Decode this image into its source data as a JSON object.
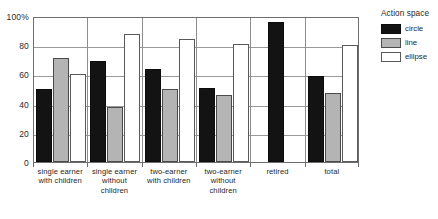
{
  "chart_data": {
    "type": "bar",
    "title": "",
    "subtitle": "",
    "xlabel": "",
    "ylabel": "",
    "ylim": [
      0,
      100
    ],
    "yticks": [
      0,
      20,
      40,
      60,
      80,
      100
    ],
    "ytick_labels": [
      "0",
      "20",
      "40",
      "60",
      "80",
      "100%"
    ],
    "grid": true,
    "legend_position": "right",
    "legend_title": "Action space",
    "categories": [
      "single earner with children",
      "single earner without children",
      "two-earner with children",
      "two-earner without children",
      "retired",
      "total"
    ],
    "category_lines": [
      [
        "single earner",
        "with children"
      ],
      [
        "single earner",
        "without children"
      ],
      [
        "two-earner",
        "with children"
      ],
      [
        "two-earner",
        "without children"
      ],
      [
        "retired",
        ""
      ],
      [
        "total",
        ""
      ]
    ],
    "series": [
      {
        "name": "circle",
        "color": "#131313",
        "values": [
          50,
          69,
          64,
          51,
          96,
          59
        ]
      },
      {
        "name": "line",
        "color": "#b4b4b4",
        "values": [
          71,
          38,
          50,
          46,
          null,
          47
        ]
      },
      {
        "name": "ellipse",
        "color": "#ffffff",
        "values": [
          60,
          88,
          84,
          81,
          null,
          80
        ]
      }
    ]
  },
  "legend": {
    "title": "Action space",
    "items": [
      {
        "label": "circle",
        "swatch": "circle"
      },
      {
        "label": "line",
        "swatch": "line"
      },
      {
        "label": "ellipse",
        "swatch": "ellipse"
      }
    ]
  },
  "axes": {
    "y": {
      "labels": [
        "100%",
        "80",
        "60",
        "40",
        "20",
        "0"
      ],
      "values": [
        100,
        80,
        60,
        40,
        20,
        0
      ]
    }
  }
}
